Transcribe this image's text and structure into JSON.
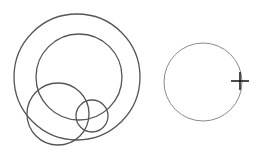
{
  "canvas": {
    "width": 267,
    "height": 162,
    "background": "#ffffff",
    "stroke_color": "#555555",
    "light_stroke_color": "#8a8a8a",
    "shapes": [
      {
        "name": "large-outer-circle",
        "cx": 77,
        "cy": 77,
        "r": 63
      },
      {
        "name": "inner-circle",
        "cx": 79,
        "cy": 77,
        "r": 43
      },
      {
        "name": "lower-left-circle",
        "cx": 58,
        "cy": 114,
        "r": 31
      },
      {
        "name": "small-circle",
        "cx": 92,
        "cy": 116,
        "r": 16
      },
      {
        "name": "right-circle",
        "cx": 203,
        "cy": 82,
        "r": 39
      }
    ],
    "cursor": {
      "type": "crosshair",
      "x": 240,
      "y": 81,
      "size": 9
    }
  }
}
